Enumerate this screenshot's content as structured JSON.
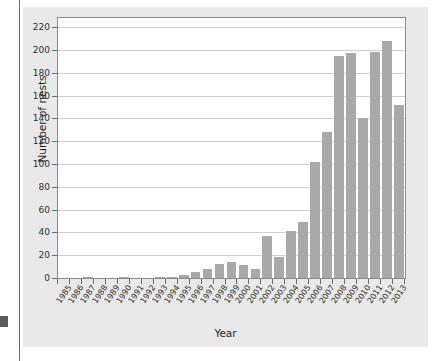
{
  "chart_data": {
    "type": "bar",
    "title": "",
    "xlabel": "Year",
    "ylabel": "Number of nests",
    "ylim": [
      0,
      228
    ],
    "yticks": [
      0,
      20,
      40,
      60,
      80,
      100,
      120,
      140,
      160,
      180,
      200,
      220
    ],
    "grid": true,
    "legend": "none",
    "bar_color": "#a9a9a9",
    "plot_background": "#ffffff",
    "panel_background": "#e9e9e9",
    "categories": [
      "1985",
      "1986",
      "1987",
      "1988",
      "1989",
      "1990",
      "1991",
      "1992",
      "1993",
      "1994",
      "1995",
      "1996",
      "1997",
      "1998",
      "1999",
      "2000",
      "2001",
      "2002",
      "2003",
      "2004",
      "2005",
      "2006",
      "2007",
      "2008",
      "2009",
      "2010",
      "2011",
      "2012",
      "2013"
    ],
    "values": [
      0,
      0,
      1,
      0,
      0,
      1,
      0,
      0,
      1,
      1,
      3,
      5,
      8,
      12,
      14,
      11,
      8,
      37,
      18,
      41,
      49,
      102,
      128,
      195,
      197,
      140,
      198,
      208,
      152
    ]
  }
}
